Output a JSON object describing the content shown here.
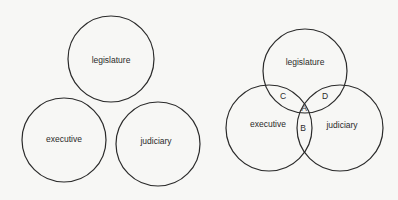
{
  "separate_diagram": {
    "circles": [
      {
        "label": "legislature"
      },
      {
        "label": "executive"
      },
      {
        "label": "judiciary"
      }
    ]
  },
  "overlapping_diagram": {
    "circles": [
      {
        "label": "legislature"
      },
      {
        "label": "executive"
      },
      {
        "label": "judiciary"
      }
    ],
    "regions": [
      {
        "label": "A"
      },
      {
        "label": "B"
      },
      {
        "label": "C"
      },
      {
        "label": "D"
      }
    ]
  }
}
